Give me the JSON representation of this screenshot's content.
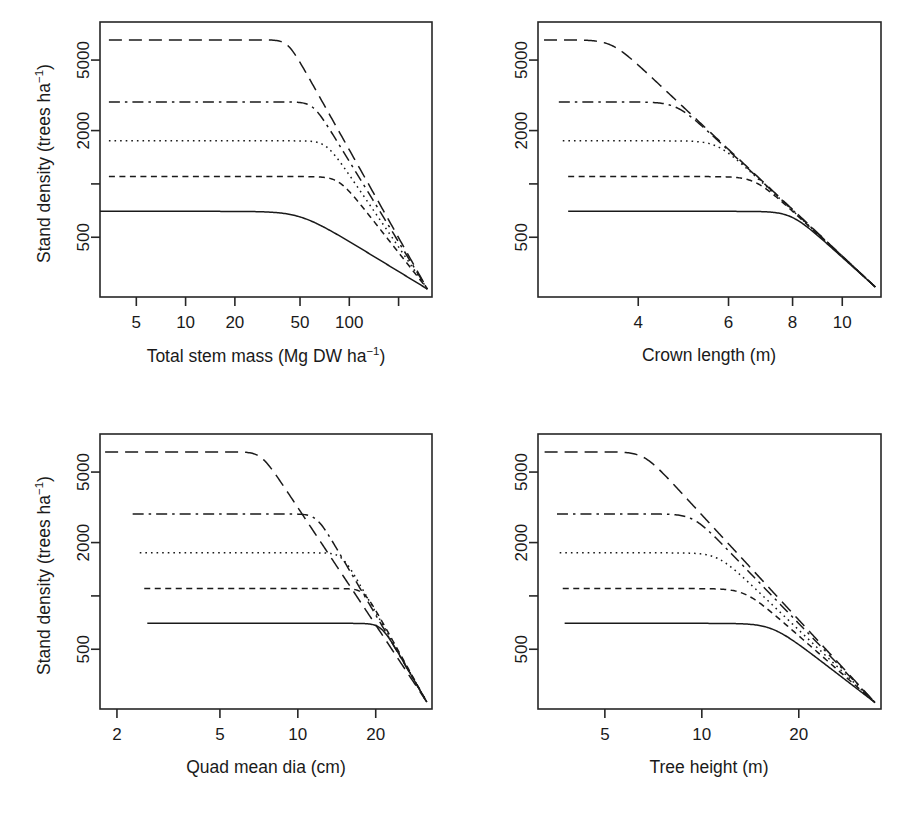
{
  "figure": {
    "name": "stand-density-self-thinning-panels",
    "panel_count": 4,
    "background": "#ffffff",
    "line_color": "#1a1a1a"
  },
  "shared": {
    "ylabel": "Stand density (trees ha",
    "ylabel_sup": "−1",
    "ylabel_tail": ")",
    "ylabel_full": "Stand density (trees ha⁻¹)",
    "y_tick_values": [
      5000,
      2000,
      1000,
      500
    ],
    "y_tick_labels": [
      "5000",
      "2000",
      "",
      "500"
    ],
    "y_axis_scale": "log",
    "ylim": [
      230,
      8200
    ],
    "series_styles": [
      {
        "name": "longdash",
        "dash": "13,7",
        "plateau": 6500
      },
      {
        "name": "dashdot",
        "dash": "11,5,2.5,5",
        "plateau": 2900
      },
      {
        "name": "dotted",
        "dash": "1.6,4",
        "plateau": 1750
      },
      {
        "name": "shortdash",
        "dash": "6,4.5",
        "plateau": 1100
      },
      {
        "name": "solid",
        "dash": "none",
        "plateau": 700
      }
    ]
  },
  "chart_data": [
    {
      "id": "panel-total-stem-mass",
      "position": "top-left",
      "type": "line",
      "title": "",
      "xlabel": "Total stem mass (Mg DW ha⁻¹)",
      "xlabel_text": "Total stem mass (Mg DW ha",
      "xlabel_sup": "−1",
      "xlabel_tail": ")",
      "ylabel": "Stand density (trees ha⁻¹)",
      "x_scale": "log",
      "y_scale": "log",
      "xlim": [
        3.0,
        320.0
      ],
      "ylim": [
        230,
        8200
      ],
      "x_ticks": [
        5,
        10,
        20,
        50,
        100,
        200
      ],
      "x_tick_labels": [
        "5",
        "10",
        "20",
        "50",
        "100",
        ""
      ],
      "y_ticks": [
        5000,
        2000,
        1000,
        500
      ],
      "y_tick_labels": [
        "5000",
        "2000",
        "",
        "500"
      ],
      "grid": false,
      "legend": "none",
      "convergence_point": {
        "x": 300.0,
        "y": 255
      },
      "series": [
        {
          "name": "longdash",
          "style": "longdash",
          "plateau": 6500,
          "knee_x": 42.0,
          "start_x": 3.4
        },
        {
          "name": "dashdot",
          "style": "dashdot",
          "plateau": 2900,
          "knee_x": 60.0,
          "start_x": 3.4
        },
        {
          "name": "dotted",
          "style": "dotted",
          "plateau": 1750,
          "knee_x": 72.0,
          "start_x": 3.4
        },
        {
          "name": "shortdash",
          "style": "shortdash",
          "plateau": 1100,
          "knee_x": 86.0,
          "start_x": 3.4
        },
        {
          "name": "solid",
          "style": "solid",
          "plateau": 700,
          "knee_x": 50.0,
          "start_x": 3.0
        }
      ]
    },
    {
      "id": "panel-crown-length",
      "position": "top-right",
      "type": "line",
      "title": "",
      "xlabel": "Crown length (m)",
      "xlabel_text": "Crown length (m)",
      "xlabel_sup": "",
      "xlabel_tail": "",
      "ylabel": "",
      "x_scale": "log",
      "y_scale": "log",
      "xlim": [
        2.55,
        11.9
      ],
      "ylim": [
        230,
        8200
      ],
      "x_ticks": [
        4,
        6,
        8,
        10
      ],
      "x_tick_labels": [
        "4",
        "6",
        "8",
        "10"
      ],
      "y_ticks": [
        5000,
        2000,
        1000,
        500
      ],
      "y_tick_labels": [
        "5000",
        "2000",
        "",
        "500"
      ],
      "grid": false,
      "legend": "none",
      "convergence_point": {
        "x": 11.6,
        "y": 262
      },
      "series": [
        {
          "name": "longdash",
          "style": "longdash",
          "plateau": 6500,
          "knee_x": 3.55,
          "start_x": 2.62
        },
        {
          "name": "dashdot",
          "style": "dashdot",
          "plateau": 2900,
          "knee_x": 4.75,
          "start_x": 2.8
        },
        {
          "name": "dotted",
          "style": "dotted",
          "plateau": 1750,
          "knee_x": 5.7,
          "start_x": 2.85
        },
        {
          "name": "shortdash",
          "style": "shortdash",
          "plateau": 1100,
          "knee_x": 6.75,
          "start_x": 2.92
        },
        {
          "name": "solid",
          "style": "solid",
          "plateau": 700,
          "knee_x": 7.95,
          "start_x": 2.92
        }
      ]
    },
    {
      "id": "panel-quad-mean-dia",
      "position": "bottom-left",
      "type": "line",
      "title": "",
      "xlabel": "Quad mean dia (cm)",
      "xlabel_text": "Quad mean dia (cm)",
      "xlabel_sup": "",
      "xlabel_tail": "",
      "ylabel": "Stand density (trees ha⁻¹)",
      "x_scale": "log",
      "y_scale": "log",
      "xlim": [
        1.72,
        33.0
      ],
      "ylim": [
        230,
        8200
      ],
      "x_ticks": [
        2,
        5,
        10,
        20
      ],
      "x_tick_labels": [
        "2",
        "5",
        "10",
        "20"
      ],
      "y_ticks": [
        5000,
        2000,
        1000,
        500
      ],
      "y_tick_labels": [
        "5000",
        "2000",
        "",
        "500"
      ],
      "grid": false,
      "legend": "none",
      "convergence_point": {
        "x": 31.5,
        "y": 252
      },
      "series": [
        {
          "name": "longdash",
          "style": "longdash",
          "plateau": 6500,
          "knee_x": 7.2,
          "start_x": 1.8
        },
        {
          "name": "dashdot",
          "style": "dashdot",
          "plateau": 2900,
          "knee_x": 11.8,
          "start_x": 2.3
        },
        {
          "name": "dotted",
          "style": "dotted",
          "plateau": 1750,
          "knee_x": 14.8,
          "start_x": 2.45
        },
        {
          "name": "shortdash",
          "style": "shortdash",
          "plateau": 1100,
          "knee_x": 18.0,
          "start_x": 2.55
        },
        {
          "name": "solid",
          "style": "solid",
          "plateau": 700,
          "knee_x": 21.0,
          "start_x": 2.62
        }
      ]
    },
    {
      "id": "panel-tree-height",
      "position": "bottom-right",
      "type": "line",
      "title": "",
      "xlabel": "Tree height (m)",
      "xlabel_text": "Tree height (m)",
      "xlabel_sup": "",
      "xlabel_tail": "",
      "ylabel": "",
      "x_scale": "log",
      "y_scale": "log",
      "xlim": [
        3.1,
        36.0
      ],
      "ylim": [
        230,
        8200
      ],
      "x_ticks": [
        5,
        10,
        20
      ],
      "x_tick_labels": [
        "5",
        "10",
        "20"
      ],
      "y_ticks": [
        5000,
        2000,
        1000,
        500
      ],
      "y_tick_labels": [
        "5000",
        "2000",
        "",
        "500"
      ],
      "grid": false,
      "legend": "none",
      "convergence_point": {
        "x": 34.5,
        "y": 250
      },
      "series": [
        {
          "name": "longdash",
          "style": "longdash",
          "plateau": 6500,
          "knee_x": 6.6,
          "start_x": 3.25
        },
        {
          "name": "dashdot",
          "style": "dashdot",
          "plateau": 2900,
          "knee_x": 9.4,
          "start_x": 3.55
        },
        {
          "name": "dotted",
          "style": "dotted",
          "plateau": 1750,
          "knee_x": 11.2,
          "start_x": 3.62
        },
        {
          "name": "shortdash",
          "style": "shortdash",
          "plateau": 1100,
          "knee_x": 13.6,
          "start_x": 3.7
        },
        {
          "name": "solid",
          "style": "solid",
          "plateau": 700,
          "knee_x": 16.5,
          "start_x": 3.75
        }
      ]
    }
  ]
}
